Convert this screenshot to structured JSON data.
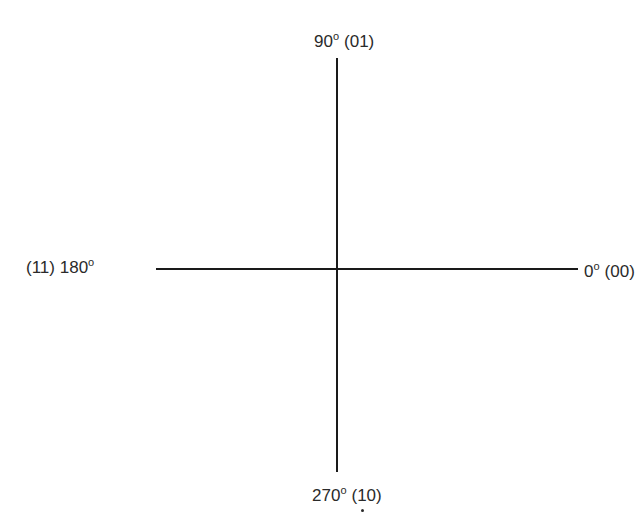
{
  "diagram": {
    "type": "phase-constellation-axes",
    "axes": {
      "horizontal": {
        "from": "180°",
        "to": "0°"
      },
      "vertical": {
        "from": "270°",
        "to": "90°"
      }
    },
    "points": [
      {
        "position": "top",
        "angle": "90",
        "degree_symbol": "o",
        "code": "(01)"
      },
      {
        "position": "left",
        "angle": "180",
        "degree_symbol": "o",
        "code": "(11)"
      },
      {
        "position": "right",
        "angle": "0",
        "degree_symbol": "o",
        "code": "(00)"
      },
      {
        "position": "bottom",
        "angle": "270",
        "degree_symbol": "o",
        "code": "(10)"
      }
    ],
    "colors": {
      "line": "#1a1a1a",
      "text": "#2a2a2a",
      "background": "#ffffff"
    }
  }
}
